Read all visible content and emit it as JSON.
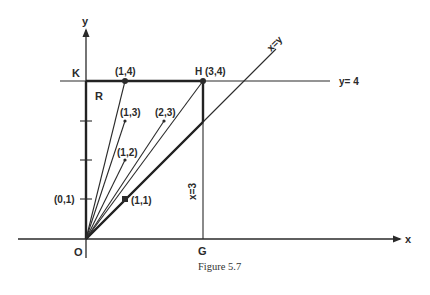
{
  "figure": {
    "caption": "Figure 5.7",
    "axes": {
      "x_label": "x",
      "y_label": "y",
      "origin_label": "O"
    },
    "lines": {
      "y_equals_4": "y= 4",
      "x_equals_y": "x=y",
      "x_equals_3": "x=3"
    },
    "points": {
      "K": "K",
      "H": "H (3,4)",
      "G": "G",
      "R": "R",
      "p14": "(1,4)",
      "p13": "(1,3)",
      "p23": "(2,3)",
      "p12": "(1,2)",
      "p01": "(0,1)",
      "p11": "(1,1)"
    },
    "colors": {
      "ink": "#2a2a2a",
      "background": "#ffffff"
    }
  }
}
